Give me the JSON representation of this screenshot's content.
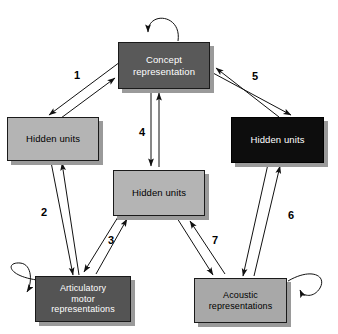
{
  "diagram": {
    "background_color": "#ffffff",
    "nodes": [
      {
        "id": "concept",
        "label": "Concept\nrepresentation",
        "fill": "#595959",
        "text_color": "#ffffff",
        "x": 118,
        "y": 42,
        "w": 92,
        "h": 47,
        "font_size": 9.5
      },
      {
        "id": "hidden-left",
        "label": "Hidden units",
        "fill": "#b4b4b4",
        "text_color": "#000000",
        "x": 7,
        "y": 117,
        "w": 92,
        "h": 44,
        "font_size": 9.5
      },
      {
        "id": "hidden-right",
        "label": "Hidden units",
        "fill": "#0d0d0d",
        "text_color": "#ffffff",
        "x": 231,
        "y": 117,
        "w": 93,
        "h": 46,
        "font_size": 9.5
      },
      {
        "id": "hidden-center",
        "label": "Hidden units",
        "fill": "#b4b4b4",
        "text_color": "#000000",
        "x": 113,
        "y": 170,
        "w": 92,
        "h": 46,
        "font_size": 9.5
      },
      {
        "id": "articulatory",
        "label": "Articulatory\nmotor\nrepresentations",
        "fill": "#545454",
        "text_color": "#ffffff",
        "x": 35,
        "y": 276,
        "w": 96,
        "h": 46,
        "font_size": 9
      },
      {
        "id": "acoustic",
        "label": "Acoustic\nrepresentations",
        "fill": "#a8a8a8",
        "text_color": "#000000",
        "x": 194,
        "y": 278,
        "w": 93,
        "h": 45,
        "font_size": 9
      }
    ],
    "edge_labels": [
      {
        "id": "edge-1",
        "text": "1",
        "x": 74,
        "y": 70
      },
      {
        "id": "edge-2",
        "text": "2",
        "x": 41,
        "y": 207
      },
      {
        "id": "edge-3",
        "text": "3",
        "x": 108,
        "y": 235
      },
      {
        "id": "edge-4",
        "text": "4",
        "x": 139,
        "y": 127
      },
      {
        "id": "edge-5",
        "text": "5",
        "x": 252,
        "y": 71
      },
      {
        "id": "edge-6",
        "text": "6",
        "x": 288,
        "y": 210
      },
      {
        "id": "edge-7",
        "text": "7",
        "x": 212,
        "y": 235
      }
    ],
    "connections": [
      {
        "id": "conn-concept-hidden-left",
        "label": "1",
        "from": "concept",
        "to": "hidden-left",
        "bidirectional": true
      },
      {
        "id": "conn-hidden-left-articulatory",
        "label": "2",
        "from": "hidden-left",
        "to": "articulatory",
        "bidirectional": true
      },
      {
        "id": "conn-center-articulatory",
        "label": "3",
        "from": "hidden-center",
        "to": "articulatory",
        "bidirectional": true
      },
      {
        "id": "conn-concept-center",
        "label": "4",
        "from": "concept",
        "to": "hidden-center",
        "bidirectional": true
      },
      {
        "id": "conn-concept-hidden-right",
        "label": "5",
        "from": "concept",
        "to": "hidden-right",
        "bidirectional": true
      },
      {
        "id": "conn-hidden-right-acoustic",
        "label": "6",
        "from": "hidden-right",
        "to": "acoustic",
        "bidirectional": true
      },
      {
        "id": "conn-center-acoustic",
        "label": "7",
        "from": "hidden-center",
        "to": "acoustic",
        "bidirectional": true
      }
    ],
    "self_loops": [
      {
        "id": "loop-concept",
        "node": "concept"
      },
      {
        "id": "loop-articulatory",
        "node": "articulatory"
      },
      {
        "id": "loop-acoustic",
        "node": "acoustic"
      }
    ]
  }
}
